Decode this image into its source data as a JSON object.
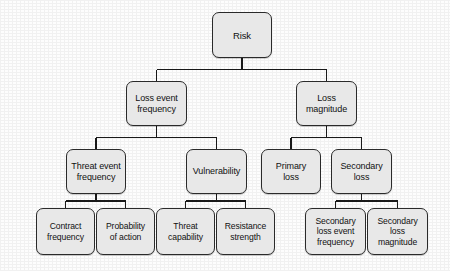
{
  "diagram": {
    "type": "tree",
    "box_fill": "#e8e8e8",
    "box_border": "#2a2a2a",
    "edge_color": "#1a1a1a",
    "background": "#fdfdfd"
  },
  "nodes": {
    "risk": {
      "label": "Risk",
      "level": 0,
      "x": 212,
      "y": 12,
      "w": 60,
      "h": 46
    },
    "loss_event_frequency": {
      "label": "Loss event\nfrequency",
      "level": 1,
      "x": 126,
      "y": 81,
      "w": 61,
      "h": 45
    },
    "loss_magnitude": {
      "label": "Loss\nmagnitude",
      "level": 1,
      "x": 296,
      "y": 81,
      "w": 61,
      "h": 45
    },
    "threat_event_frequency": {
      "label": "Threat event\nfrequency",
      "level": 2,
      "x": 66,
      "y": 149,
      "w": 60,
      "h": 45
    },
    "vulnerability": {
      "label": "Vulnerability",
      "level": 2,
      "x": 186,
      "y": 149,
      "w": 61,
      "h": 45
    },
    "primary_loss": {
      "label": "Primary\nloss",
      "level": 2,
      "x": 261,
      "y": 149,
      "w": 60,
      "h": 45
    },
    "secondary_loss": {
      "label": "Secondary\nloss",
      "level": 2,
      "x": 331,
      "y": 149,
      "w": 61,
      "h": 45
    },
    "contract_frequency": {
      "label": "Contract\nfrequency",
      "level": 3,
      "x": 36,
      "y": 208,
      "w": 59,
      "h": 47
    },
    "probability_of_action": {
      "label": "Probability\nof action",
      "level": 3,
      "x": 96,
      "y": 208,
      "w": 59,
      "h": 47
    },
    "threat_capability": {
      "label": "Threat\ncapability",
      "level": 3,
      "x": 156,
      "y": 208,
      "w": 59,
      "h": 47
    },
    "resistance_strength": {
      "label": "Resistance\nstrength",
      "level": 3,
      "x": 216,
      "y": 208,
      "w": 59,
      "h": 47
    },
    "secondary_loss_event_frequency": {
      "label": "Secondary\nloss event\nfrequency",
      "level": 3,
      "x": 305,
      "y": 208,
      "w": 61,
      "h": 47
    },
    "secondary_loss_magnitude": {
      "label": "Secondary\nloss\nmagnitude",
      "level": 3,
      "x": 367,
      "y": 208,
      "w": 61,
      "h": 47
    }
  },
  "edges": [
    {
      "from": "risk",
      "to": "loss_event_frequency"
    },
    {
      "from": "risk",
      "to": "loss_magnitude"
    },
    {
      "from": "loss_event_frequency",
      "to": "threat_event_frequency"
    },
    {
      "from": "loss_event_frequency",
      "to": "vulnerability"
    },
    {
      "from": "loss_magnitude",
      "to": "primary_loss"
    },
    {
      "from": "loss_magnitude",
      "to": "secondary_loss"
    },
    {
      "from": "threat_event_frequency",
      "to": "contract_frequency"
    },
    {
      "from": "threat_event_frequency",
      "to": "probability_of_action"
    },
    {
      "from": "vulnerability",
      "to": "threat_capability"
    },
    {
      "from": "vulnerability",
      "to": "resistance_strength"
    },
    {
      "from": "secondary_loss",
      "to": "secondary_loss_event_frequency"
    },
    {
      "from": "secondary_loss",
      "to": "secondary_loss_magnitude"
    }
  ]
}
